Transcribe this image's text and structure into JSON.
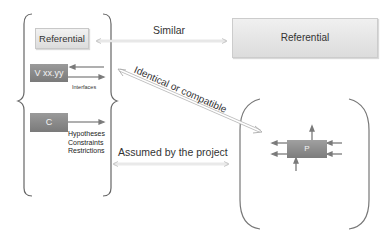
{
  "diagram": {
    "left_group": {
      "referential_label": "Referential",
      "version_label": "V xx.yy",
      "interfaces_label": "Interfaces",
      "c_label": "C",
      "constraints_lines": [
        "Hypotheses",
        "Constraints",
        "Restrictions"
      ]
    },
    "right_referential_label": "Referential",
    "project_label": "P",
    "relations": {
      "similar": "Similar",
      "identical": "Identical or compatible",
      "assumed": "Assumed by the project"
    },
    "colors": {
      "light_box": "#e4e4e4",
      "dark_box": "#8a8a8a",
      "arrow": "#7a7a7a",
      "bracket": "#666666"
    }
  }
}
